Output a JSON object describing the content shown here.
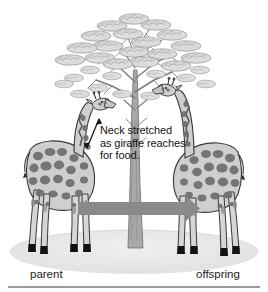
{
  "figure": {
    "background_color": "#ffffff",
    "width": 268,
    "height": 292
  },
  "annotation": {
    "caption_lines": [
      "Neck stretched",
      "as giraffe reaches",
      "for food."
    ],
    "caption_line_1": "Neck stretched",
    "caption_line_2": "as giraffe reaches",
    "caption_line_3": "for food.",
    "pointer_icon": "double-headed-arrow-icon",
    "pointer_color": "#1a1a1a"
  },
  "labels": {
    "left": "parent",
    "right": "offspring",
    "color": "#1c1c1c"
  },
  "arrow": {
    "name": "generation-arrow-icon",
    "direction": "right",
    "color": "#8a8a8a"
  },
  "scene": {
    "tree": {
      "name": "acacia-tree",
      "foliage_color": "#d6d6d6",
      "trunk_color": "#9c9c9c",
      "outline_color": "#6a6a6a"
    },
    "giraffe_left": {
      "name": "giraffe-parent",
      "facing": "right",
      "coat_color": "#d9d9d9",
      "spot_color": "#6e6e6e",
      "hoof_color": "#111111"
    },
    "giraffe_right": {
      "name": "giraffe-offspring",
      "facing": "left",
      "coat_color": "#d9d9d9",
      "spot_color": "#6e6e6e",
      "hoof_color": "#111111"
    },
    "ground": {
      "name": "ground-ellipse",
      "color": "#e8e8e8"
    }
  },
  "rule": {
    "name": "bottom-divider",
    "color": "#9a9a9a"
  }
}
